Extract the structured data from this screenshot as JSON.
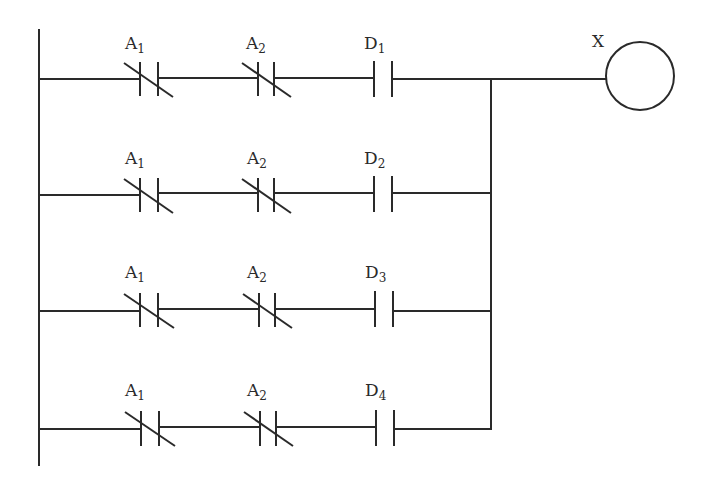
{
  "diagram": {
    "type": "ladder-logic",
    "colors": {
      "line": "#2a2a2a",
      "background": "#ffffff"
    },
    "output_coil": {
      "label": "X"
    },
    "rungs": [
      {
        "contacts": [
          {
            "letter": "A",
            "sub": "1",
            "type": "normally-closed"
          },
          {
            "letter": "A",
            "sub": "2",
            "type": "normally-closed"
          },
          {
            "letter": "D",
            "sub": "1",
            "type": "normally-open"
          }
        ]
      },
      {
        "contacts": [
          {
            "letter": "A",
            "sub": "1",
            "type": "normally-closed"
          },
          {
            "letter": "A",
            "sub": "2",
            "type": "normally-closed"
          },
          {
            "letter": "D",
            "sub": "2",
            "type": "normally-open"
          }
        ]
      },
      {
        "contacts": [
          {
            "letter": "A",
            "sub": "1",
            "type": "normally-closed"
          },
          {
            "letter": "A",
            "sub": "2",
            "type": "normally-closed"
          },
          {
            "letter": "D",
            "sub": "3",
            "type": "normally-open"
          }
        ]
      },
      {
        "contacts": [
          {
            "letter": "A",
            "sub": "1",
            "type": "normally-closed"
          },
          {
            "letter": "A",
            "sub": "2",
            "type": "normally-closed"
          },
          {
            "letter": "D",
            "sub": "4",
            "type": "normally-open"
          }
        ]
      }
    ]
  }
}
